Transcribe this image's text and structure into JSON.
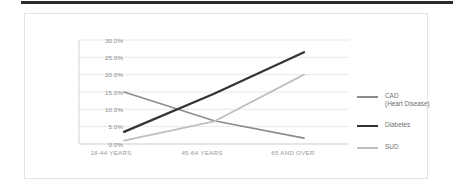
{
  "chart_data": {
    "type": "line",
    "title": "",
    "subtitle": "",
    "xlabel": "",
    "ylabel": "",
    "categories": [
      "18-44 YEARS",
      "45-64 YEARS",
      "65 AND OVER"
    ],
    "ylim": [
      0,
      30
    ],
    "ytick_labels": [
      "30.0%",
      "25.0%",
      "20.0%",
      "15.0%",
      "10.0%",
      "5.0%",
      "0.0%"
    ],
    "ytick_values": [
      30,
      25,
      20,
      15,
      10,
      5,
      0
    ],
    "grid": "horizontal",
    "legend_position": "right",
    "series": [
      {
        "name": "CAD\n(Heart Disease)",
        "legend_label": "CAD\n(Heart Disease)",
        "color": "#8c8c8c",
        "width": 1.6,
        "values": [
          15.0,
          6.7,
          1.7
        ]
      },
      {
        "name": "Diabetes",
        "legend_label": "Diabetes",
        "color": "#333333",
        "width": 2.2,
        "values": [
          3.5,
          14.5,
          26.5
        ]
      },
      {
        "name": "SUD",
        "legend_label": "SUD",
        "color": "#bfbfbf",
        "width": 1.8,
        "values": [
          1.0,
          6.5,
          20.0
        ]
      }
    ]
  },
  "colors": {
    "top_bar": "#2b2b2b",
    "frame_border": "#e3e3e3",
    "gridline": "#e8e8e8",
    "axis_line": "#d5d5d5",
    "tick_text": "#8a8a8a",
    "category_text": "#9a9a9a",
    "legend_text": "#6f6f6f"
  }
}
